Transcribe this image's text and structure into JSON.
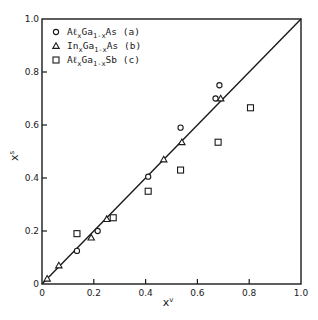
{
  "chart_data": {
    "type": "scatter",
    "title": "",
    "xlabel": "x^v",
    "ylabel": "x^s",
    "xlim": [
      0,
      1.0
    ],
    "ylim": [
      0,
      1.0
    ],
    "grid": false,
    "legend_position": "upper-left",
    "x_ticks": [
      "0",
      "0.2",
      "0.4",
      "0.6",
      "0.8",
      "1.0"
    ],
    "y_ticks": [
      "0",
      "0.2",
      "0.4",
      "0.6",
      "0.8",
      "1.0"
    ],
    "reference_line": {
      "label": "x^s = x^v",
      "from": [
        0,
        0
      ],
      "to": [
        1,
        1
      ]
    },
    "series": [
      {
        "name": "AlxGa1-xAs (a)",
        "marker": "circle",
        "points": [
          [
            0.135,
            0.125
          ],
          [
            0.215,
            0.2
          ],
          [
            0.41,
            0.405
          ],
          [
            0.535,
            0.59
          ],
          [
            0.67,
            0.7
          ],
          [
            0.685,
            0.75
          ]
        ]
      },
      {
        "name": "InxGa1-xAs (b)",
        "marker": "triangle",
        "points": [
          [
            0.02,
            0.02
          ],
          [
            0.065,
            0.07
          ],
          [
            0.19,
            0.175
          ],
          [
            0.25,
            0.245
          ],
          [
            0.47,
            0.47
          ],
          [
            0.54,
            0.535
          ],
          [
            0.69,
            0.7
          ]
        ]
      },
      {
        "name": "AlxGa1-xSb (c)",
        "marker": "square",
        "points": [
          [
            0.135,
            0.19
          ],
          [
            0.275,
            0.25
          ],
          [
            0.41,
            0.35
          ],
          [
            0.535,
            0.43
          ],
          [
            0.68,
            0.535
          ],
          [
            0.805,
            0.665
          ]
        ]
      }
    ]
  },
  "legend": [
    {
      "marker": "circle",
      "pre": "Aℓ",
      "sub1": "x",
      "mid": "Ga",
      "sub2": "1-x",
      "post": "As",
      "tag": "(a)"
    },
    {
      "marker": "triangle",
      "pre": "In",
      "sub1": "x",
      "mid": "Ga",
      "sub2": "1-x",
      "post": "As",
      "tag": "(b)"
    },
    {
      "marker": "square",
      "pre": "Aℓ",
      "sub1": "x",
      "mid": "Ga",
      "sub2": "1-x",
      "post": "Sb",
      "tag": "(c)"
    }
  ],
  "axes": {
    "x_label_main": "x",
    "x_label_sup": "v",
    "y_label_main": "x",
    "y_label_sup": "s",
    "origin_label": "0"
  },
  "colors": {
    "ink": "#1a1a1a",
    "background": "#ffffff"
  }
}
